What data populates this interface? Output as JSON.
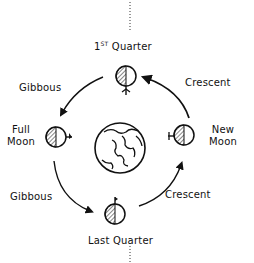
{
  "diagram": {
    "center": {
      "label": "Earth",
      "icon": "earth-icon"
    },
    "phases": {
      "first_quarter": {
        "ordinal": "1",
        "ordinal_suffix": "ST",
        "label": "Quarter"
      },
      "full_moon": {
        "line1": "Full",
        "line2": "Moon"
      },
      "new_moon": {
        "line1": "New",
        "line2": "Moon"
      },
      "last_quarter": {
        "label": "Last Quarter"
      }
    },
    "transitions": {
      "top_left": "Gibbous",
      "top_right": "Crescent",
      "bottom_left": "Gibbous",
      "bottom_right": "Crescent"
    },
    "colors": {
      "ink": "#111111",
      "background": "#ffffff"
    }
  }
}
